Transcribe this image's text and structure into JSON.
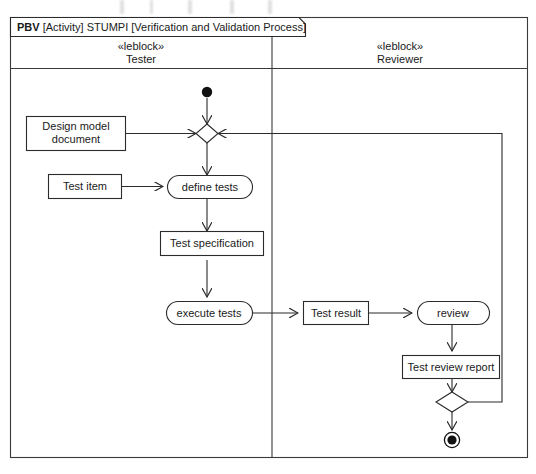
{
  "diagram": {
    "frame": {
      "tab_keyword": "PBV",
      "tab_text": " [Activity] STUMPI [Verification and Validation Process]"
    },
    "partitions": [
      {
        "stereotype": "«leblock»",
        "name": "Tester"
      },
      {
        "stereotype": "«leblock»",
        "name": "Reviewer"
      }
    ],
    "nodes": {
      "initial": "initial-node",
      "merge": "merge-node",
      "decision": "decision-node",
      "final": "activity-final-node",
      "actions": [
        {
          "id": "define-tests",
          "label": "define tests"
        },
        {
          "id": "execute-tests",
          "label": "execute tests"
        },
        {
          "id": "review",
          "label": "review"
        }
      ],
      "objects": [
        {
          "id": "design-model-document",
          "line1": "Design model",
          "line2": "document"
        },
        {
          "id": "test-item",
          "label": "Test item"
        },
        {
          "id": "test-specification",
          "label": "Test specification"
        },
        {
          "id": "test-result",
          "label": "Test result"
        },
        {
          "id": "test-review-report",
          "label": "Test review report"
        }
      ]
    },
    "colors": {
      "stroke": "#2b2b2b",
      "frame": "#3a3a3a",
      "fill": "#ffffff",
      "node": "#111111"
    }
  }
}
